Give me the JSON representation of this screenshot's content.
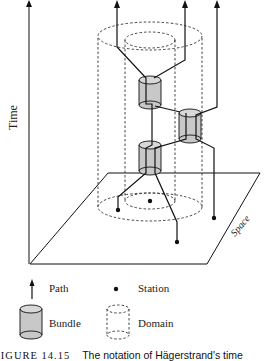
{
  "diagram": {
    "axes": {
      "time_label": "Time",
      "space_label": "Space"
    },
    "legend": {
      "path": "Path",
      "station": "Station",
      "bundle": "Bundle",
      "domain": "Domain"
    },
    "caption": {
      "figure_number": "FIGURE 14.15",
      "text": "The notation of Hägerstrand's time"
    },
    "colors": {
      "line": "#111111",
      "bundle_fill": "#c8c8c8",
      "dashed": "#333333"
    }
  }
}
